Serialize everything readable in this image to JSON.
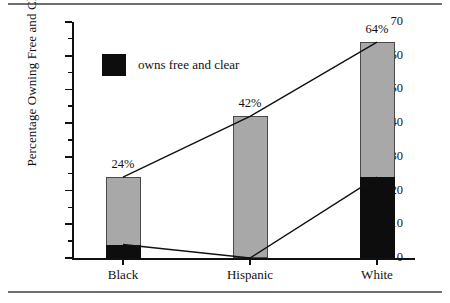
{
  "chart_data": {
    "type": "bar",
    "title": "",
    "subtitle": "",
    "xlabel": "",
    "ylabel": "Percentage Owning Free and Clear",
    "categories": [
      "Black",
      "Hispanic",
      "White"
    ],
    "ylim": [
      0,
      70
    ],
    "ytick_step": 10,
    "yminor_step": 5,
    "ytick_labels": [
      "0",
      "10",
      "20",
      "30",
      "40",
      "50",
      "60",
      "70"
    ],
    "grid": false,
    "legend_position": "upper-left-inside",
    "legend": [
      {
        "label": "owns free and clear",
        "color": "#0d0d0d"
      }
    ],
    "series": [
      {
        "name": "owns free and clear",
        "color": "#0d0d0d",
        "values": [
          4,
          0,
          24
        ]
      },
      {
        "name": "total owning",
        "color": "#a8a8a8",
        "values": [
          24,
          42,
          64
        ]
      }
    ],
    "data_labels": [
      "24%",
      "42%",
      "64%"
    ],
    "annotations": [
      "Line connects the tops of the total-owning bars across Black, Hispanic, White",
      "Line connects the tops of the owns-free-and-clear segments across Black, Hispanic, White"
    ]
  },
  "colors": {
    "bar_gray": "#a8a8a8",
    "bar_black": "#0d0d0d",
    "axis": "#111111",
    "rule": "#6f6f6f"
  }
}
